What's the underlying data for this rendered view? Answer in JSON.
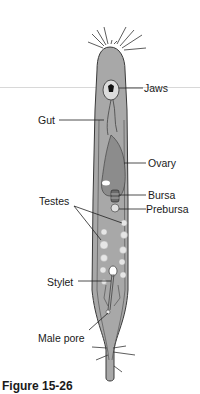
{
  "figure": {
    "caption": "Figure 15-26",
    "colors": {
      "body_fill": "#a8a8a8",
      "outline": "#3a3a3a",
      "ovary_fill": "#8c8c8c",
      "testes_fill": "#e6e6e6",
      "background": "#ffffff"
    }
  },
  "labels": {
    "jaws": "Jaws",
    "gut": "Gut",
    "ovary": "Ovary",
    "bursa": "Bursa",
    "prebursa": "Prebursa",
    "testes": "Testes",
    "stylet": "Stylet",
    "male_pore": "Male pore"
  }
}
